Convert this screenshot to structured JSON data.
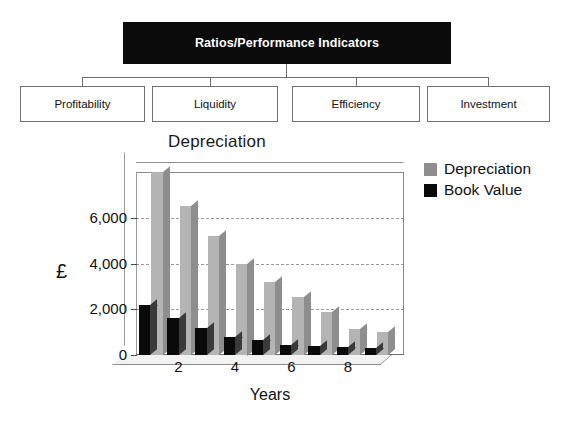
{
  "diagram": {
    "root": {
      "label": "Ratios/Performance Indicators"
    },
    "leaves": [
      {
        "label": "Profitability"
      },
      {
        "label": "Liquidity"
      },
      {
        "label": "Efficiency"
      },
      {
        "label": "Investment"
      }
    ]
  },
  "chart_data": {
    "type": "bar",
    "title": "Depreciation",
    "xlabel": "Years",
    "ylabel": "£",
    "ylim": [
      0,
      8000
    ],
    "yticks": [
      0,
      2000,
      4000,
      6000
    ],
    "ytick_labels": [
      "0",
      "2,000",
      "4,000",
      "6,000"
    ],
    "grid": true,
    "grid_style": "dashed",
    "legend_position": "right",
    "categories": [
      1,
      2,
      3,
      4,
      5,
      6,
      7,
      8,
      9
    ],
    "xtick_labels": [
      "2",
      "4",
      "6",
      "8"
    ],
    "xtick_categories": [
      2,
      4,
      6,
      8
    ],
    "series": [
      {
        "name": "Depreciation",
        "color": "#b4b4b4",
        "values": [
          8000,
          6500,
          5200,
          4000,
          3200,
          2550,
          1900,
          1150,
          1000
        ]
      },
      {
        "name": "Book Value",
        "color": "#0a0a0a",
        "values": [
          2200,
          1600,
          1200,
          800,
          650,
          450,
          400,
          350,
          300
        ]
      }
    ]
  },
  "legend": {
    "items": [
      {
        "label": "Depreciation",
        "color": "#8e8e8e"
      },
      {
        "label": "Book Value",
        "color": "#0a0a0a"
      }
    ]
  }
}
